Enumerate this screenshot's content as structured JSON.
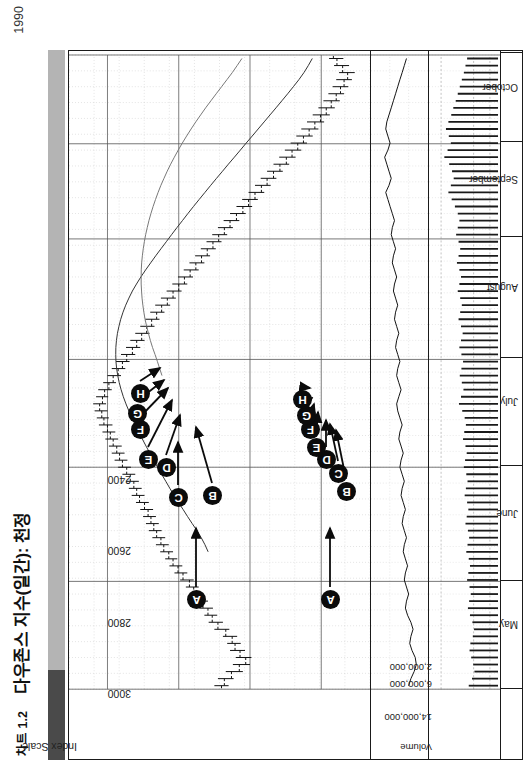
{
  "header": {
    "chart_number": "차트 1.2",
    "title": "다우존스 지수(일간): 천정",
    "year": "1990"
  },
  "panels": {
    "price_scale_caption": "Index Scale",
    "volume_caption": "Volume"
  },
  "markers": [
    "A",
    "B",
    "C",
    "D",
    "E",
    "F",
    "G",
    "H"
  ],
  "chart_data": {
    "type": "line",
    "title": "다우존스 지수(일간): 천정",
    "subtitle": "차트 1.2",
    "year": "1990",
    "xlabel": "",
    "ylabel": "Index Scale",
    "grid": true,
    "legend": "none",
    "orientation": "rotated-90",
    "month_labels": [
      "May",
      "June",
      "July",
      "August",
      "September",
      "October"
    ],
    "month_boundaries_pct": [
      0.0,
      17.0,
      35.0,
      52.0,
      71.0,
      86.0,
      100.0
    ],
    "price_panel": {
      "ylabel": "Index Scale",
      "ytick_labels": [
        "3000",
        "2800",
        "2600",
        "2400"
      ],
      "ytick_values": [
        3000,
        2800,
        2600,
        2400
      ],
      "ylim": [
        2280,
        3080
      ],
      "series_type": "ohlc-bars-with-moving-averages",
      "moving_averages": [
        "MA-slow",
        "MA-fast"
      ],
      "ohlc": [
        {
          "i": 0,
          "o": 2680,
          "h": 2700,
          "l": 2660,
          "c": 2672
        },
        {
          "i": 1,
          "o": 2672,
          "h": 2690,
          "l": 2646,
          "c": 2652
        },
        {
          "i": 2,
          "o": 2652,
          "h": 2668,
          "l": 2620,
          "c": 2630
        },
        {
          "i": 3,
          "o": 2630,
          "h": 2648,
          "l": 2600,
          "c": 2612
        },
        {
          "i": 4,
          "o": 2612,
          "h": 2640,
          "l": 2596,
          "c": 2628
        },
        {
          "i": 5,
          "o": 2628,
          "h": 2656,
          "l": 2614,
          "c": 2642
        },
        {
          "i": 6,
          "o": 2642,
          "h": 2664,
          "l": 2626,
          "c": 2650
        },
        {
          "i": 7,
          "o": 2650,
          "h": 2676,
          "l": 2636,
          "c": 2668
        },
        {
          "i": 8,
          "o": 2668,
          "h": 2700,
          "l": 2658,
          "c": 2690
        },
        {
          "i": 9,
          "o": 2690,
          "h": 2716,
          "l": 2676,
          "c": 2706
        },
        {
          "i": 10,
          "o": 2706,
          "h": 2728,
          "l": 2692,
          "c": 2718
        },
        {
          "i": 11,
          "o": 2718,
          "h": 2742,
          "l": 2704,
          "c": 2732
        },
        {
          "i": 12,
          "o": 2732,
          "h": 2754,
          "l": 2718,
          "c": 2744
        },
        {
          "i": 13,
          "o": 2744,
          "h": 2766,
          "l": 2730,
          "c": 2758
        },
        {
          "i": 14,
          "o": 2758,
          "h": 2780,
          "l": 2744,
          "c": 2770
        },
        {
          "i": 15,
          "o": 2770,
          "h": 2796,
          "l": 2758,
          "c": 2788
        },
        {
          "i": 16,
          "o": 2788,
          "h": 2812,
          "l": 2776,
          "c": 2802
        },
        {
          "i": 17,
          "o": 2802,
          "h": 2826,
          "l": 2790,
          "c": 2816
        },
        {
          "i": 18,
          "o": 2816,
          "h": 2838,
          "l": 2804,
          "c": 2828
        },
        {
          "i": 19,
          "o": 2828,
          "h": 2852,
          "l": 2816,
          "c": 2842
        },
        {
          "i": 20,
          "o": 2842,
          "h": 2864,
          "l": 2828,
          "c": 2850
        },
        {
          "i": 21,
          "o": 2850,
          "h": 2874,
          "l": 2838,
          "c": 2862
        },
        {
          "i": 22,
          "o": 2862,
          "h": 2884,
          "l": 2848,
          "c": 2870
        },
        {
          "i": 23,
          "o": 2870,
          "h": 2892,
          "l": 2856,
          "c": 2878
        },
        {
          "i": 24,
          "o": 2878,
          "h": 2900,
          "l": 2864,
          "c": 2886
        },
        {
          "i": 25,
          "o": 2886,
          "h": 2908,
          "l": 2872,
          "c": 2896
        },
        {
          "i": 26,
          "o": 2896,
          "h": 2920,
          "l": 2884,
          "c": 2910
        },
        {
          "i": 27,
          "o": 2910,
          "h": 2932,
          "l": 2896,
          "c": 2918
        },
        {
          "i": 28,
          "o": 2918,
          "h": 2940,
          "l": 2904,
          "c": 2926
        },
        {
          "i": 29,
          "o": 2926,
          "h": 2948,
          "l": 2912,
          "c": 2936
        },
        {
          "i": 30,
          "o": 2936,
          "h": 2958,
          "l": 2922,
          "c": 2946
        },
        {
          "i": 31,
          "o": 2946,
          "h": 2970,
          "l": 2934,
          "c": 2958
        },
        {
          "i": 32,
          "o": 2958,
          "h": 2980,
          "l": 2944,
          "c": 2966
        },
        {
          "i": 33,
          "o": 2966,
          "h": 2988,
          "l": 2952,
          "c": 2974
        },
        {
          "i": 34,
          "o": 2974,
          "h": 2996,
          "l": 2960,
          "c": 2984
        },
        {
          "i": 35,
          "o": 2984,
          "h": 3006,
          "l": 2970,
          "c": 2992
        },
        {
          "i": 36,
          "o": 2992,
          "h": 3014,
          "l": 2978,
          "c": 3000
        },
        {
          "i": 37,
          "o": 3000,
          "h": 3024,
          "l": 2986,
          "c": 3010
        },
        {
          "i": 38,
          "o": 3010,
          "h": 3030,
          "l": 2996,
          "c": 3016
        },
        {
          "i": 39,
          "o": 3016,
          "h": 3036,
          "l": 3000,
          "c": 3022
        },
        {
          "i": 40,
          "o": 3022,
          "h": 3040,
          "l": 3004,
          "c": 3014
        },
        {
          "i": 41,
          "o": 3014,
          "h": 3032,
          "l": 2998,
          "c": 3008
        },
        {
          "i": 42,
          "o": 3008,
          "h": 3026,
          "l": 2988,
          "c": 2996
        },
        {
          "i": 43,
          "o": 2996,
          "h": 3012,
          "l": 2976,
          "c": 2984
        },
        {
          "i": 44,
          "o": 2984,
          "h": 3000,
          "l": 2962,
          "c": 2970
        },
        {
          "i": 45,
          "o": 2970,
          "h": 2988,
          "l": 2950,
          "c": 2958
        },
        {
          "i": 46,
          "o": 2958,
          "h": 2976,
          "l": 2938,
          "c": 2946
        },
        {
          "i": 47,
          "o": 2946,
          "h": 2962,
          "l": 2922,
          "c": 2930
        },
        {
          "i": 48,
          "o": 2930,
          "h": 2948,
          "l": 2908,
          "c": 2918
        },
        {
          "i": 49,
          "o": 2918,
          "h": 2936,
          "l": 2896,
          "c": 2904
        },
        {
          "i": 50,
          "o": 2904,
          "h": 2922,
          "l": 2882,
          "c": 2890
        },
        {
          "i": 51,
          "o": 2890,
          "h": 2908,
          "l": 2868,
          "c": 2876
        },
        {
          "i": 52,
          "o": 2876,
          "h": 2894,
          "l": 2854,
          "c": 2862
        },
        {
          "i": 53,
          "o": 2862,
          "h": 2880,
          "l": 2840,
          "c": 2848
        },
        {
          "i": 54,
          "o": 2848,
          "h": 2866,
          "l": 2824,
          "c": 2832
        },
        {
          "i": 55,
          "o": 2832,
          "h": 2850,
          "l": 2808,
          "c": 2816
        },
        {
          "i": 56,
          "o": 2816,
          "h": 2834,
          "l": 2792,
          "c": 2800
        },
        {
          "i": 57,
          "o": 2800,
          "h": 2818,
          "l": 2776,
          "c": 2784
        },
        {
          "i": 58,
          "o": 2784,
          "h": 2802,
          "l": 2760,
          "c": 2768
        },
        {
          "i": 59,
          "o": 2768,
          "h": 2786,
          "l": 2744,
          "c": 2752
        },
        {
          "i": 60,
          "o": 2752,
          "h": 2770,
          "l": 2728,
          "c": 2736
        },
        {
          "i": 61,
          "o": 2736,
          "h": 2754,
          "l": 2712,
          "c": 2720
        },
        {
          "i": 62,
          "o": 2720,
          "h": 2738,
          "l": 2696,
          "c": 2704
        },
        {
          "i": 63,
          "o": 2704,
          "h": 2722,
          "l": 2680,
          "c": 2688
        },
        {
          "i": 64,
          "o": 2688,
          "h": 2706,
          "l": 2664,
          "c": 2672
        },
        {
          "i": 65,
          "o": 2672,
          "h": 2690,
          "l": 2648,
          "c": 2656
        },
        {
          "i": 66,
          "o": 2656,
          "h": 2674,
          "l": 2630,
          "c": 2638
        },
        {
          "i": 67,
          "o": 2638,
          "h": 2656,
          "l": 2612,
          "c": 2620
        },
        {
          "i": 68,
          "o": 2620,
          "h": 2638,
          "l": 2594,
          "c": 2604
        },
        {
          "i": 69,
          "o": 2604,
          "h": 2622,
          "l": 2578,
          "c": 2586
        },
        {
          "i": 70,
          "o": 2586,
          "h": 2604,
          "l": 2560,
          "c": 2568
        },
        {
          "i": 71,
          "o": 2568,
          "h": 2586,
          "l": 2542,
          "c": 2552
        },
        {
          "i": 72,
          "o": 2552,
          "h": 2570,
          "l": 2526,
          "c": 2534
        },
        {
          "i": 73,
          "o": 2534,
          "h": 2552,
          "l": 2508,
          "c": 2516
        },
        {
          "i": 74,
          "o": 2516,
          "h": 2534,
          "l": 2490,
          "c": 2498
        },
        {
          "i": 75,
          "o": 2498,
          "h": 2518,
          "l": 2472,
          "c": 2482
        },
        {
          "i": 76,
          "o": 2482,
          "h": 2502,
          "l": 2456,
          "c": 2466
        },
        {
          "i": 77,
          "o": 2466,
          "h": 2486,
          "l": 2440,
          "c": 2450
        },
        {
          "i": 78,
          "o": 2450,
          "h": 2470,
          "l": 2424,
          "c": 2434
        },
        {
          "i": 79,
          "o": 2434,
          "h": 2456,
          "l": 2408,
          "c": 2418
        },
        {
          "i": 80,
          "o": 2418,
          "h": 2440,
          "l": 2392,
          "c": 2402
        },
        {
          "i": 81,
          "o": 2402,
          "h": 2424,
          "l": 2376,
          "c": 2386
        },
        {
          "i": 82,
          "o": 2386,
          "h": 2408,
          "l": 2362,
          "c": 2372
        },
        {
          "i": 83,
          "o": 2372,
          "h": 2394,
          "l": 2348,
          "c": 2358
        },
        {
          "i": 84,
          "o": 2358,
          "h": 2380,
          "l": 2336,
          "c": 2346
        },
        {
          "i": 85,
          "o": 2346,
          "h": 2368,
          "l": 2324,
          "c": 2336
        },
        {
          "i": 86,
          "o": 2336,
          "h": 2358,
          "l": 2314,
          "c": 2326
        },
        {
          "i": 87,
          "o": 2326,
          "h": 2350,
          "l": 2306,
          "c": 2340
        },
        {
          "i": 88,
          "o": 2340,
          "h": 2364,
          "l": 2322,
          "c": 2356
        },
        {
          "i": 89,
          "o": 2356,
          "h": 2378,
          "l": 2338,
          "c": 2366
        }
      ]
    },
    "oscillator_panel": {
      "label": "",
      "series_type": "line",
      "values": [
        52,
        50,
        47,
        45,
        46,
        49,
        51,
        50,
        48,
        50,
        53,
        55,
        54,
        52,
        54,
        56,
        55,
        53,
        55,
        57,
        56,
        54,
        56,
        58,
        57,
        55,
        57,
        59,
        58,
        56,
        58,
        60,
        59,
        57,
        59,
        61,
        60,
        58,
        60,
        62,
        63,
        61,
        59,
        61,
        63,
        62,
        60,
        62,
        64,
        63,
        61,
        63,
        65,
        64,
        62,
        64,
        66,
        65,
        63,
        65,
        67,
        66,
        64,
        66,
        68,
        67,
        65,
        67,
        69,
        71,
        73,
        70,
        68,
        70,
        72,
        74,
        71,
        69,
        71,
        73,
        72,
        70,
        68,
        66,
        64,
        62,
        60,
        58,
        56,
        54
      ]
    },
    "volume_panel": {
      "caption": "Volume",
      "ytick_labels": [
        "14,000,000",
        "6,000,000",
        "2,000,000"
      ],
      "ytick_values": [
        14000000,
        6000000,
        2000000
      ],
      "ylim": [
        0,
        16000000
      ],
      "values": [
        7200000,
        6400000,
        5800000,
        6100000,
        6600000,
        7000000,
        6800000,
        6200000,
        5900000,
        6300000,
        6900000,
        7400000,
        7100000,
        6700000,
        7000000,
        7600000,
        7300000,
        6900000,
        7200000,
        7800000,
        7500000,
        7100000,
        7400000,
        8000000,
        7700000,
        7300000,
        7600000,
        8200000,
        7900000,
        7500000,
        7800000,
        8400000,
        8100000,
        7700000,
        8000000,
        8600000,
        8300000,
        7900000,
        8200000,
        8800000,
        9600000,
        9100000,
        8500000,
        8900000,
        9400000,
        9000000,
        8600000,
        9000000,
        9500000,
        9100000,
        8700000,
        9100000,
        9700000,
        9300000,
        8900000,
        9300000,
        9900000,
        9500000,
        9100000,
        9500000,
        10100000,
        9700000,
        9300000,
        9700000,
        10300000,
        9900000,
        9500000,
        9900000,
        10600000,
        11400000,
        12200000,
        11600000,
        10900000,
        11300000,
        12000000,
        13200000,
        12400000,
        11600000,
        12100000,
        12800000,
        12200000,
        11500000,
        11000000,
        10400000,
        9900000,
        9400000,
        8900000,
        8400000,
        8000000,
        7600000
      ]
    }
  }
}
